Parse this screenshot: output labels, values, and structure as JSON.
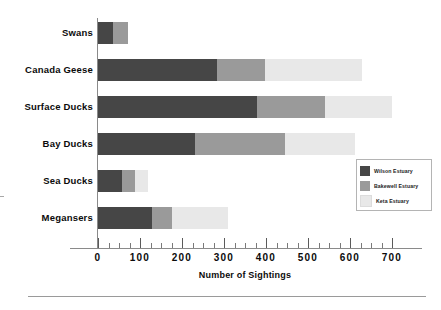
{
  "chart_data": {
    "type": "bar",
    "orientation": "horizontal",
    "stacked": true,
    "title": "",
    "xlabel": "Number of Sightings",
    "ylabel": "",
    "xlim": [
      0,
      700
    ],
    "xticks": [
      0,
      100,
      200,
      300,
      400,
      500,
      600,
      700
    ],
    "xtick_labels": [
      "0",
      "100",
      "200",
      "300",
      "400",
      "500",
      "600",
      "700"
    ],
    "minor_tick_step": 25,
    "grid": false,
    "legend_position": "center right",
    "categories": [
      "Swans",
      "Canada Geese",
      "Surface Ducks",
      "Bay Ducks",
      "Sea Ducks",
      "Megansers"
    ],
    "series": [
      {
        "name": "Wilson Estuary",
        "color": "#464646",
        "values": [
          36,
          283,
          379,
          231,
          57,
          129
        ]
      },
      {
        "name": "Bakewell Estuary",
        "color": "#9a9a9a",
        "values": [
          35,
          115,
          162,
          214,
          31,
          47
        ]
      },
      {
        "name": "Keta Estuary",
        "color": "#e8e8e8",
        "values": [
          0,
          231,
          159,
          167,
          31,
          134
        ]
      }
    ],
    "totals": [
      71,
      629,
      700,
      612,
      119,
      310
    ]
  },
  "axis": {
    "x_title": "Number of Sightings"
  },
  "legend": {
    "entries": [
      {
        "label": "Wilson Estuary",
        "color": "#464646"
      },
      {
        "label": "Bakewell Estuary",
        "color": "#9a9a9a"
      },
      {
        "label": "Keta Estuary",
        "color": "#e8e8e8"
      }
    ]
  }
}
